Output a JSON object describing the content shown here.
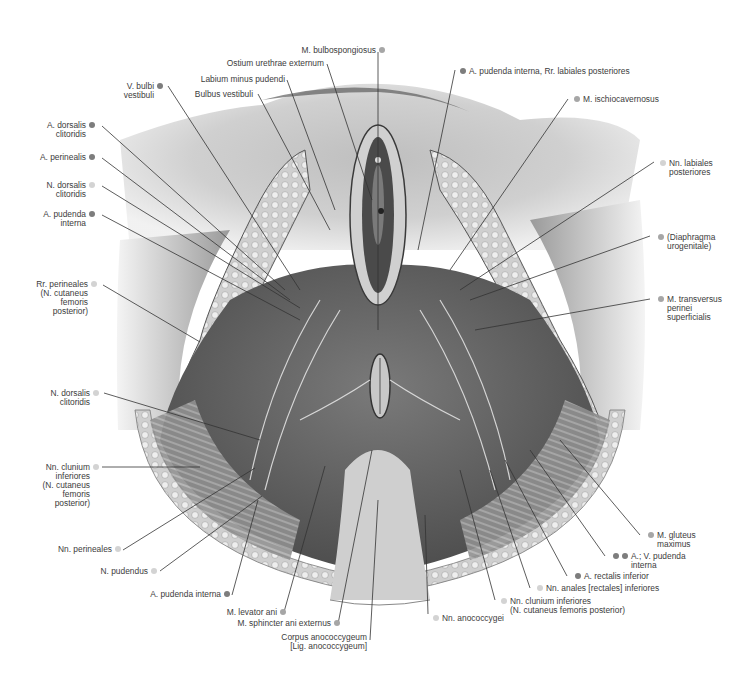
{
  "legend_colors": {
    "artery": "#7d7d7d",
    "muscle": "#a6a6a6",
    "nerve": "#d3d3d3"
  },
  "labels": {
    "m_bulbospongiosus": {
      "lines": [
        "M. bulbospongiosus"
      ],
      "dot": "muscle"
    },
    "ostium_urethrae": {
      "lines": [
        "Ostium urethrae externum"
      ]
    },
    "labium_minus": {
      "lines": [
        "Labium minus pudendi"
      ]
    },
    "bulbus_vestibuli": {
      "lines": [
        "Bulbus vestibuli"
      ]
    },
    "v_bulbi": {
      "lines": [
        "V. bulbi",
        "vestibuli"
      ],
      "dot": "artery"
    },
    "a_dorsalis_clitoridis": {
      "lines": [
        "A. dorsalis",
        "clitoridis"
      ],
      "dot": "artery"
    },
    "a_perinealis": {
      "lines": [
        "A. perinealis"
      ],
      "dot": "artery"
    },
    "n_dorsalis_clitoridis_top": {
      "lines": [
        "N. dorsalis",
        "clitoridis"
      ],
      "dot": "nerve"
    },
    "a_pudenda_interna_left": {
      "lines": [
        "A. pudenda",
        "interna"
      ],
      "dot": "artery"
    },
    "rr_perineales": {
      "lines": [
        "Rr. perineales",
        "(N. cutaneus",
        "femoris",
        "posterior)"
      ],
      "dot": "nerve"
    },
    "n_dorsalis_clitoridis_mid": {
      "lines": [
        "N. dorsalis",
        "clitoridis"
      ],
      "dot": "nerve"
    },
    "nn_clunium_left": {
      "lines": [
        "Nn. clunium",
        "inferiores",
        "(N. cutaneus",
        "femoris",
        "posterior)"
      ],
      "dot": "nerve"
    },
    "nn_perineales": {
      "lines": [
        "Nn. perineales"
      ],
      "dot": "nerve"
    },
    "n_pudendus": {
      "lines": [
        "N. pudendus"
      ],
      "dot": "nerve"
    },
    "a_pudenda_interna_bottom": {
      "lines": [
        "A. pudenda interna"
      ],
      "dot": "artery"
    },
    "m_levator_ani": {
      "lines": [
        "M. levator ani"
      ],
      "dot": "muscle"
    },
    "m_sphincter_ani": {
      "lines": [
        "M. sphincter ani externus"
      ],
      "dot": "muscle"
    },
    "corpus_anococcygeum": {
      "lines": [
        "Corpus anococcygeum",
        "[Lig. anococcygeum]"
      ]
    },
    "a_pudenda_rr_labiales": {
      "lines": [
        "A. pudenda interna, Rr. labiales posteriores"
      ],
      "dot": "artery"
    },
    "m_ischiocavernosus": {
      "lines": [
        "M. ischiocavernosus"
      ],
      "dot": "muscle"
    },
    "nn_labiales": {
      "lines": [
        "Nn. labiales",
        "posteriores"
      ],
      "dot": "nerve"
    },
    "diaphragma": {
      "lines": [
        "(Diaphragma",
        "urogenitale)"
      ],
      "dot": "muscle"
    },
    "m_transversus": {
      "lines": [
        "M. transversus",
        "perinei",
        "superficialis"
      ],
      "dot": "muscle"
    },
    "m_gluteus": {
      "lines": [
        "M. gluteus",
        "maximus"
      ],
      "dot": "muscle"
    },
    "av_pudenda": {
      "lines": [
        "A.; V. pudenda",
        "interna"
      ],
      "dot": "artery"
    },
    "a_rectalis": {
      "lines": [
        "A. rectalis inferior"
      ],
      "dot": "artery"
    },
    "nn_anales": {
      "lines": [
        "Nn. anales [rectales] inferiores"
      ],
      "dot": "nerve"
    },
    "nn_clunium_right": {
      "lines": [
        "Nn. clunium inferiores",
        "(N. cutaneus femoris posterior)"
      ],
      "dot": "nerve"
    },
    "nn_anococcygei": {
      "lines": [
        "Nn. anococcygei"
      ],
      "dot": "nerve"
    }
  }
}
